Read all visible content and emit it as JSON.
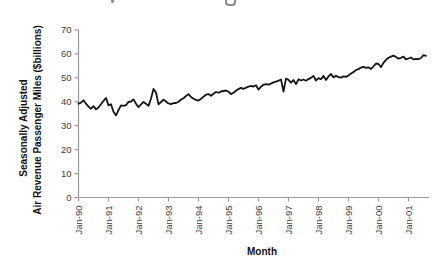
{
  "chart_data": {
    "type": "line",
    "title": "",
    "xlabel": "Month",
    "ylabel": "Seasonally Adjusted Air Revenue Passenger Miles ($billions)",
    "ylabel_line1": "Seasonally Adjusted",
    "ylabel_line2": "Air Revenue Passenger Miles ($billions)",
    "series_name": "Air Revenue Passenger Miles (seasonally adjusted)",
    "frequency": "monthly",
    "x_start": "Jan-1990",
    "x_end": "Aug-2001",
    "x_tick_labels": [
      "Jan-90",
      "Jan-91",
      "Jan-92",
      "Jan-93",
      "Jan-94",
      "Jan-95",
      "Jan-96",
      "Jan-97",
      "Jan-98",
      "Jan-99",
      "Jan-00",
      "Jan-01"
    ],
    "x_tick_interval_months": 12,
    "y_ticks": [
      70,
      60,
      50,
      40,
      30,
      20,
      10,
      0
    ],
    "ylim": [
      0,
      70
    ],
    "grid": "off",
    "legend": "none",
    "line_color": "#151515",
    "axis_color": "#9a9a9a",
    "values": [
      39.2,
      39.6,
      40.6,
      39.2,
      38.0,
      37.1,
      38.2,
      36.8,
      37.6,
      39.0,
      40.4,
      41.6,
      38.5,
      39.0,
      35.8,
      34.3,
      36.5,
      38.5,
      38.3,
      38.6,
      39.9,
      40.1,
      41.0,
      39.2,
      37.8,
      38.9,
      39.9,
      39.2,
      38.3,
      41.3,
      45.4,
      43.9,
      38.9,
      39.9,
      40.9,
      40.1,
      39.3,
      39.0,
      39.4,
      39.5,
      40.0,
      40.9,
      41.5,
      42.4,
      43.2,
      42.0,
      41.3,
      40.8,
      40.5,
      41.2,
      42.1,
      43.0,
      43.2,
      42.5,
      43.4,
      44.1,
      43.8,
      44.3,
      44.5,
      44.7,
      44.2,
      43.2,
      43.8,
      44.6,
      45.3,
      45.8,
      45.4,
      45.9,
      46.3,
      46.6,
      46.4,
      46.9,
      45.1,
      46.3,
      47.1,
      47.4,
      47.2,
      47.6,
      48.1,
      48.4,
      48.8,
      49.3,
      44.3,
      49.7,
      49.2,
      48.0,
      49.1,
      47.4,
      49.4,
      48.9,
      49.3,
      48.8,
      49.5,
      50.0,
      50.8,
      48.9,
      49.9,
      49.4,
      50.8,
      49.1,
      50.6,
      51.6,
      50.2,
      50.9,
      50.3,
      50.1,
      50.6,
      50.4,
      51.0,
      51.8,
      52.4,
      53.3,
      53.6,
      54.3,
      54.6,
      54.2,
      54.4,
      53.7,
      54.8,
      56.0,
      55.8,
      54.5,
      56.3,
      57.5,
      58.4,
      58.9,
      59.3,
      58.7,
      58.0,
      58.4,
      58.9,
      57.7,
      58.1,
      58.5,
      57.7,
      57.9,
      57.8,
      58.3,
      59.5,
      59.2
    ]
  }
}
